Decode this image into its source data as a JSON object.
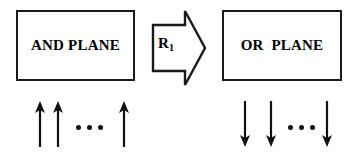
{
  "diagram": {
    "type": "block-diagram",
    "title_text": "",
    "stroke_color": "#1a1a1a",
    "fill_color": "#ffffff",
    "text_color": "#000000",
    "blocks": [
      {
        "id": "and-plane",
        "label": "AND PLANE",
        "shape": "rectangle",
        "x": 16,
        "y": 10,
        "width": 119,
        "height": 71
      },
      {
        "id": "or-plane",
        "label": "OR  PLANE",
        "shape": "rectangle",
        "x": 222,
        "y": 10,
        "width": 120,
        "height": 71
      }
    ],
    "connector": {
      "id": "transform-arrow",
      "shape": "block-arrow-right",
      "label_base": "R",
      "label_subscript": "1",
      "x": 148,
      "y": 6,
      "width": 62,
      "height": 84
    },
    "input_signals": {
      "id": "input-signals",
      "direction": "up",
      "count_shown": 3,
      "ellipsis": "• • •",
      "dot_count": 3,
      "arrow_positions": [
        9,
        27,
        93
      ]
    },
    "output_signals": {
      "id": "output-signals",
      "direction": "down",
      "count_shown": 3,
      "ellipsis": "• • •",
      "dot_count": 3,
      "arrow_positions": [
        2,
        28,
        84
      ]
    }
  }
}
